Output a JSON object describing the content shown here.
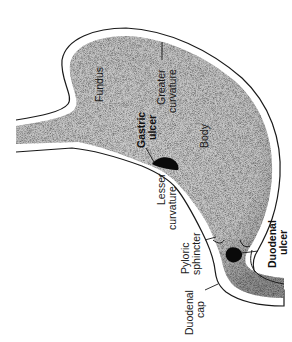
{
  "diagram": {
    "colors": {
      "background": "#ffffff",
      "stomach_fill": "#c8c8c8",
      "stomach_edge_shade": "#8a8a8a",
      "wall_outline": "#1a1a1a",
      "ulcer": "#0a0a0a",
      "text": "#1a1a1a"
    },
    "labels": {
      "fundus": "Fundus",
      "greater_curvature_line1": "Greater",
      "greater_curvature_line2": "curvature",
      "gastric_ulcer_line1": "Gastric",
      "gastric_ulcer_line2": "ulcer",
      "body": "Body",
      "lesser_curvature_line1": "Lesser",
      "lesser_curvature_line2": "curvature",
      "pyloric_sphincter_line1": "Pyloric",
      "pyloric_sphincter_line2": "sphincter",
      "duodenal_ulcer_line1": "Duodenal",
      "duodenal_ulcer_line2": "ulcer",
      "duodenal_cap_line1": "Duodenal",
      "duodenal_cap_line2": "cap"
    },
    "orientation": "rotated 90 degrees counter-clockwise (text reads bottom-to-top)"
  }
}
